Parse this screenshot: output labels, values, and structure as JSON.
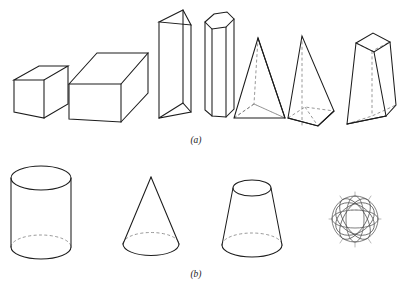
{
  "figure": {
    "background_color": "#ffffff",
    "line_color": "#1c1c1c",
    "hidden_line_color": "#7d7d7d",
    "rows": [
      {
        "id": "row-a",
        "caption": "(a)",
        "caption_x": 196,
        "caption_y": 143,
        "description": "Polyhedra: prisms and pyramids",
        "shapes": [
          {
            "name": "cube",
            "label": "Cube",
            "index": 1
          },
          {
            "name": "rectangular-prism",
            "label": "Rectangular prism",
            "index": 2
          },
          {
            "name": "triangular-prism",
            "label": "Triangular prism",
            "index": 3
          },
          {
            "name": "hexagonal-prism",
            "label": "Hexagonal prism",
            "index": 4
          },
          {
            "name": "triangular-pyramid",
            "label": "Triangular pyramid",
            "index": 5
          },
          {
            "name": "square-pyramid",
            "label": "Square pyramid",
            "index": 6
          },
          {
            "name": "truncated-pyramid",
            "label": "Truncated pyramid",
            "index": 7
          }
        ]
      },
      {
        "id": "row-b",
        "caption": "(b)",
        "caption_x": 196,
        "caption_y": 277,
        "description": "Solids of revolution",
        "shapes": [
          {
            "name": "cylinder",
            "label": "Cylinder",
            "index": 1
          },
          {
            "name": "cone",
            "label": "Cone",
            "index": 2
          },
          {
            "name": "truncated-cone",
            "label": "Truncated cone",
            "index": 3
          },
          {
            "name": "sphere",
            "label": "Sphere",
            "index": 4
          }
        ]
      }
    ]
  }
}
